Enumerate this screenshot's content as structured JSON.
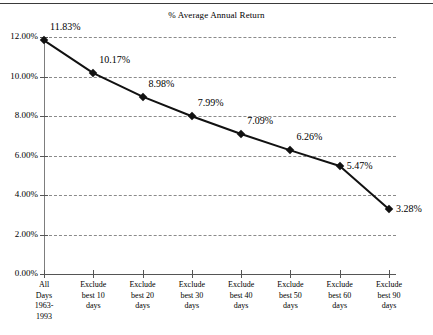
{
  "chart_data": {
    "type": "line",
    "title": "% Average Annual Return",
    "xlabel": "",
    "ylabel": "",
    "ylim": [
      0,
      12
    ],
    "ytick_step": 2,
    "grid": true,
    "legend": "none",
    "marker": "diamond",
    "line_color": "#111111",
    "categories": [
      "All\nDays\n1963-\n1993",
      "Exclude\nbest 10\ndays",
      "Exclude\nbest 20\ndays",
      "Exclude\nbest 30\ndays",
      "Exclude\nbest 40\ndays",
      "Exclude\nbest 50\ndays",
      "Exclude\nbest 60\ndays",
      "Exclude\nbest 90\ndays"
    ],
    "values": [
      11.83,
      10.17,
      8.98,
      7.99,
      7.09,
      6.26,
      5.47,
      3.28
    ],
    "point_labels": [
      "11.83%",
      "10.17%",
      "8.98%",
      "7.99%",
      "7.09%",
      "6.26%",
      "5.47%",
      "3.28%"
    ],
    "ytick_labels": [
      "0.00%",
      "2.00%",
      "4.00%",
      "6.00%",
      "8.00%",
      "10.00%",
      "12.00%"
    ],
    "ytick_values": [
      0,
      2,
      4,
      6,
      8,
      10,
      12
    ]
  }
}
